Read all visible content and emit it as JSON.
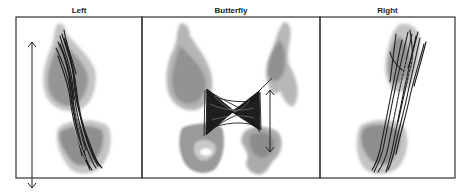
{
  "figure": {
    "panels": [
      {
        "id": "left",
        "title": "Left",
        "x": 16,
        "width": 126
      },
      {
        "id": "butterfly",
        "title": "Butterfly",
        "x": 142,
        "width": 178
      },
      {
        "id": "right",
        "title": "Right",
        "x": 320,
        "width": 135
      }
    ],
    "frame": {
      "top": 17,
      "bottom": 178
    },
    "colors": {
      "frame": "#333333",
      "density_light": "#c4c4c4",
      "density_mid": "#9a9a9a",
      "density_dark": "#7e7e7e",
      "trace": "#1c1c1c",
      "arrow": "#222222"
    },
    "annotations": {
      "left_arrow": "vertical double-headed arrow spanning left panel height",
      "butterfly_arrow": "vertical double-headed arrow beside right wing cluster"
    }
  }
}
